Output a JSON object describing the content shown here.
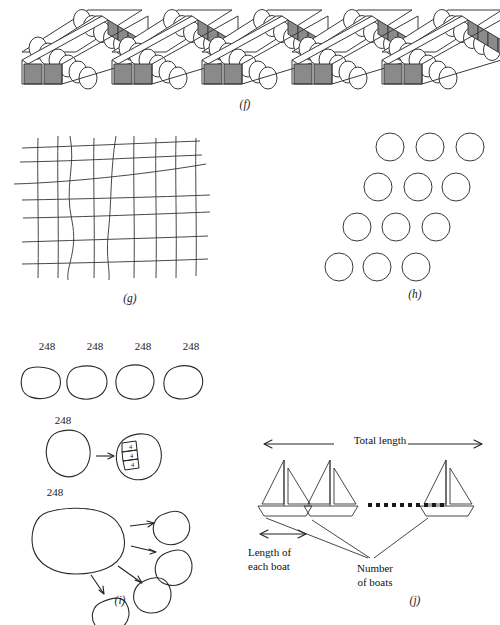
{
  "figure": {
    "panels": [
      {
        "id": "f",
        "label": "(f)",
        "content_type": "egg-cartons",
        "carton_count": 5,
        "eggs_per_carton": 12,
        "egg_rows": 2,
        "egg_columns": 6
      },
      {
        "id": "g",
        "label": "(g)",
        "content_type": "irregular-grid",
        "horizontal_lines": 7,
        "vertical_lines": 9
      },
      {
        "id": "h",
        "label": "(h)",
        "content_type": "circle-array",
        "rows": 4,
        "circles_per_row": 3,
        "total_circles": 12
      },
      {
        "id": "i",
        "label": "(i)",
        "content_type": "partitioning-blobs",
        "rows": [
          {
            "name": "four-separate-blobs",
            "blob_count": 4,
            "labels": [
              "248",
              "248",
              "248",
              "248"
            ]
          },
          {
            "name": "blob-with-segments",
            "label": "248",
            "segment_count": 3,
            "segment_values": [
              "4",
              "4",
              "4"
            ],
            "arrow": "→"
          },
          {
            "name": "blob-split-into-four",
            "label": "248",
            "arrow_count": 4,
            "result_circle_count": 4
          }
        ]
      },
      {
        "id": "j",
        "label": "(j)",
        "content_type": "boat-length-diagram",
        "boats_drawn": 3,
        "ellipsis_dots": 10,
        "annotations": {
          "total_length": "Total length",
          "length_of_each_boat_line1": "Length of",
          "length_of_each_boat_line2": "each boat",
          "number_of_boats_line1": "Number",
          "number_of_boats_line2": "of boats"
        }
      }
    ]
  },
  "colors": {
    "stroke": "#3a3a3a",
    "stroke_dark": "#222222",
    "carton_shadow": "#8a8a8a",
    "carton_light": "#d8d8d8",
    "background": "#ffffff",
    "text": "#1a1a1a"
  }
}
